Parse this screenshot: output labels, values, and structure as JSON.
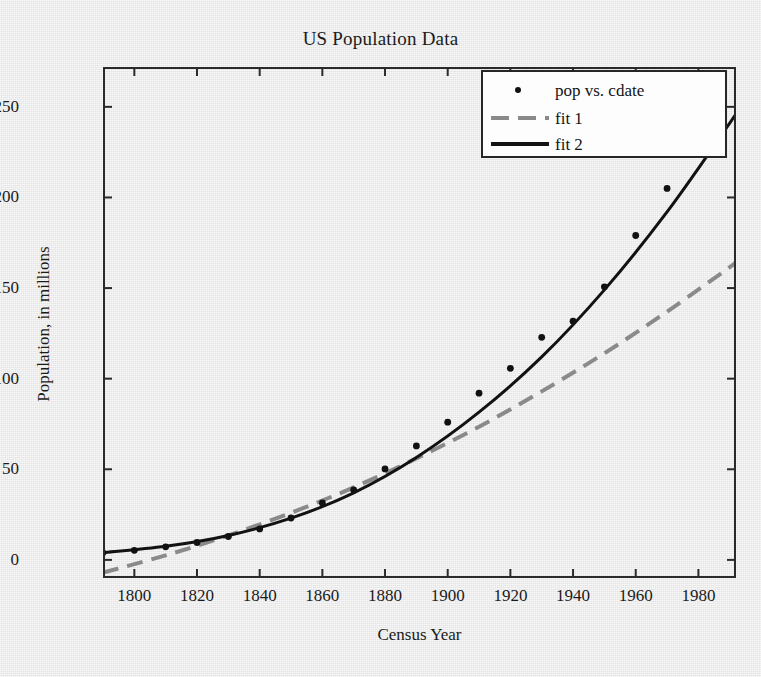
{
  "chart_data": {
    "type": "scatter",
    "title": "US Population Data",
    "xlabel": "Census Year",
    "ylabel": "Population, in millions",
    "xlim": [
      1790,
      1992
    ],
    "ylim": [
      -10,
      272
    ],
    "xticks": [
      1800,
      1820,
      1840,
      1860,
      1880,
      1900,
      1920,
      1940,
      1960,
      1980
    ],
    "yticks": [
      0,
      50,
      100,
      150,
      200,
      250
    ],
    "grid": false,
    "legend_position": "top-right",
    "series": [
      {
        "name": "pop vs. cdate",
        "type": "scatter",
        "marker": "dot",
        "color": "#111111",
        "x": [
          1790,
          1800,
          1810,
          1820,
          1830,
          1840,
          1850,
          1860,
          1870,
          1880,
          1890,
          1900,
          1910,
          1920,
          1930,
          1940,
          1950,
          1960,
          1970,
          1980
        ],
        "y": [
          3.9,
          5.3,
          7.2,
          9.6,
          12.9,
          17.1,
          23.1,
          31.4,
          38.6,
          50.2,
          62.9,
          76.0,
          92.0,
          105.7,
          122.8,
          131.7,
          150.7,
          179.0,
          205.0,
          226.5
        ]
      },
      {
        "name": "fit 1",
        "type": "line",
        "style": "dashed",
        "color": "#8a8a8a",
        "x": [
          1790,
          1810,
          1830,
          1850,
          1870,
          1890,
          1910,
          1930,
          1950,
          1970,
          1990,
          1992
        ],
        "y": [
          -7.0,
          2.5,
          13.5,
          26.0,
          40.0,
          56.0,
          73.5,
          93.0,
          114.0,
          137.0,
          161.5,
          164.0
        ]
      },
      {
        "name": "fit 2",
        "type": "line",
        "style": "solid",
        "color": "#121212",
        "x": [
          1790,
          1810,
          1830,
          1850,
          1870,
          1890,
          1910,
          1930,
          1950,
          1970,
          1990,
          1992
        ],
        "y": [
          4.0,
          7.5,
          13.5,
          23.0,
          37.0,
          56.5,
          81.5,
          112.0,
          149.0,
          192.0,
          241.0,
          247.0
        ]
      }
    ],
    "legend": [
      {
        "label": "pop vs. cdate",
        "marker": "dot",
        "color": "#111111"
      },
      {
        "label": "fit 1",
        "marker": "dashed-line",
        "color": "#8a8a8a"
      },
      {
        "label": "fit 2",
        "marker": "solid-line",
        "color": "#121212"
      }
    ]
  }
}
